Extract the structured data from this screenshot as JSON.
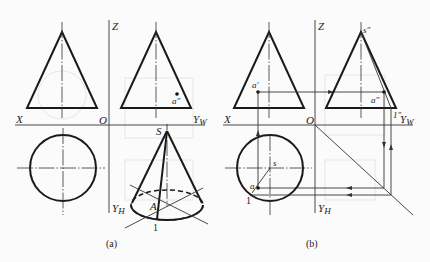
{
  "figure": {
    "panels": [
      {
        "id": "a",
        "caption": "(a)",
        "axes": {
          "x": "X",
          "z": "Z",
          "origin": "O",
          "yw": "Y",
          "yw_sub": "W",
          "yh": "Y",
          "yh_sub": "H"
        },
        "views": {
          "front": {
            "shape": "triangle",
            "description": "front view of cone"
          },
          "side": {
            "shape": "triangle",
            "point_label": "a",
            "point_prime": "″"
          },
          "top": {
            "shape": "circle"
          },
          "axonometric": {
            "apex_label": "S",
            "point_label": "A",
            "generatrix_end_label": "1"
          }
        }
      },
      {
        "id": "b",
        "caption": "(b)",
        "axes": {
          "x": "X",
          "z": "Z",
          "origin": "O",
          "yw": "Y",
          "yw_sub": "W",
          "yh": "Y",
          "yh_sub": "H"
        },
        "views": {
          "front": {
            "shape": "triangle",
            "point_label": "a",
            "point_prime": "′"
          },
          "side": {
            "shape": "triangle",
            "apex_label": "s",
            "apex_prime": "″",
            "point_label": "a",
            "point_prime": "″",
            "generatrix_end_label": "1",
            "generatrix_end_prime": "″"
          },
          "top": {
            "shape": "circle",
            "apex_label": "s",
            "point_label": "a",
            "generatrix_end_label": "1"
          }
        }
      }
    ]
  }
}
